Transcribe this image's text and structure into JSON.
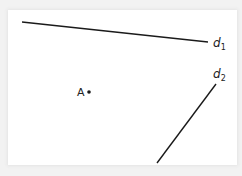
{
  "diagram": {
    "type": "geometry-figure",
    "colors": {
      "background": "#ffffff",
      "frame_shadow": "#e4e4e4",
      "stroke": "#1a1a1a"
    },
    "lines": [
      {
        "id": "d1",
        "label": "d",
        "subscript": "1",
        "x1": 22,
        "y1": 22,
        "x2": 208,
        "y2": 42
      },
      {
        "id": "d2",
        "label": "d",
        "subscript": "2",
        "x1": 216,
        "y1": 84,
        "x2": 157,
        "y2": 163
      }
    ],
    "points": [
      {
        "id": "A",
        "label": "A",
        "x": 88,
        "y": 91
      }
    ]
  }
}
